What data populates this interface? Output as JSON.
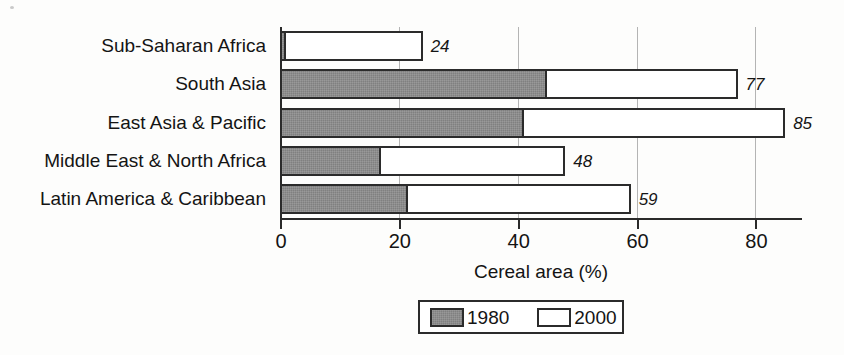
{
  "chart_data": {
    "type": "bar",
    "orientation": "horizontal",
    "title": "",
    "xlabel": "Cereal area (%)",
    "ylabel": "",
    "xlim": [
      0,
      87.5
    ],
    "xticks": [
      0,
      20,
      40,
      60,
      80
    ],
    "xtick_labels": [
      "0",
      "20",
      "40",
      "60",
      "80"
    ],
    "grid": "vertical",
    "legend_position": "bottom-center",
    "categories": [
      "Sub-Saharan Africa",
      "South Asia",
      "East Asia & Pacific",
      "Middle East & North Africa",
      "Latin America & Caribbean"
    ],
    "series": [
      {
        "name": "1980",
        "color": "#808080",
        "values": [
          1,
          45,
          41,
          17,
          21.5
        ]
      },
      {
        "name": "2000",
        "color": "#ffffff",
        "values": [
          24,
          77,
          85,
          48,
          59
        ]
      }
    ],
    "value_labels": [
      "24",
      "77",
      "85",
      "48",
      "59"
    ],
    "value_label_style": "italic"
  },
  "legend": {
    "entries": [
      {
        "label": "1980",
        "swatch": "gray"
      },
      {
        "label": "2000",
        "swatch": "white"
      }
    ]
  },
  "colors": {
    "bar_1980": "#808080",
    "bar_2000": "#ffffff",
    "outline": "#2b2b2b",
    "gridline": "#b4b4b4",
    "text": "#141414",
    "background": "#fdfdfc"
  }
}
